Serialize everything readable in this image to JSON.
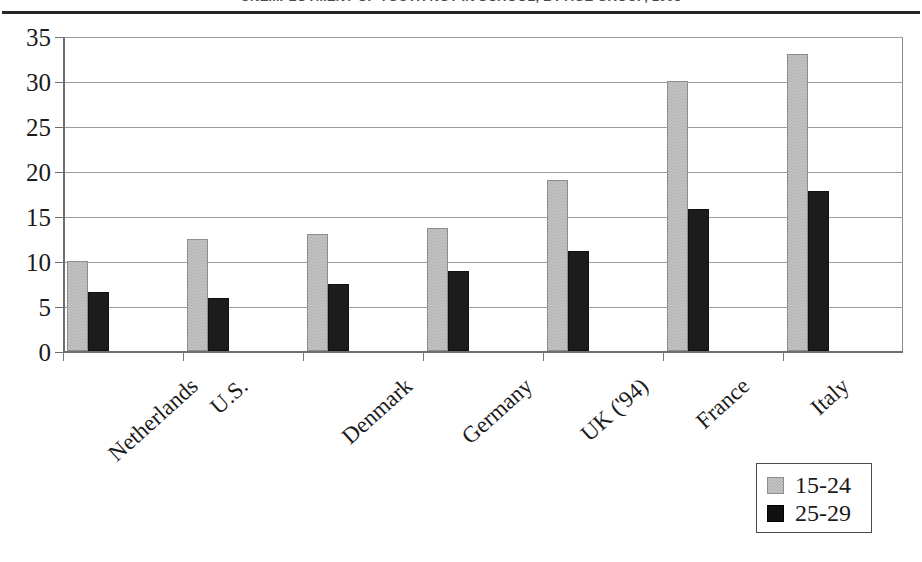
{
  "chart_data": {
    "type": "bar",
    "title": "UNEMPLOYMENT OF YOUTH NOT IN SCHOOL, BY AGE GROUP, 1995",
    "xlabel": "",
    "ylabel": "",
    "ylim": [
      0,
      35
    ],
    "ytick_values": [
      0,
      5,
      10,
      15,
      20,
      25,
      30,
      35
    ],
    "ytick_labels": [
      "0",
      "5",
      "10",
      "15",
      "20",
      "25",
      "30",
      "35"
    ],
    "grid": true,
    "legend_position": "bottom-right",
    "categories": [
      "Netherlands",
      "U.S.",
      "Denmark",
      "Germany",
      "UK ('94)",
      "France",
      "Italy"
    ],
    "series": [
      {
        "name": "15-24",
        "color": "#c8c8c8",
        "values": [
          10.0,
          12.5,
          13.0,
          13.7,
          19.0,
          30.0,
          33.0
        ]
      },
      {
        "name": "25-29",
        "color": "#1c1c1c",
        "values": [
          6.6,
          5.9,
          7.5,
          8.9,
          11.1,
          15.8,
          17.8
        ]
      }
    ]
  },
  "legend": {
    "items": [
      {
        "label": "15-24",
        "swatch": "light-hatched-swatch"
      },
      {
        "label": "25-29",
        "swatch": "black-swatch"
      }
    ]
  }
}
